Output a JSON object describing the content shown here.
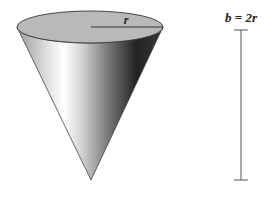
{
  "figure": {
    "cone": {
      "radius_label": "r",
      "top_color": "#b8b8b8",
      "rim_color": "#333333"
    },
    "scale_bar": {
      "label": "b = 2r",
      "color": "#555555"
    }
  }
}
